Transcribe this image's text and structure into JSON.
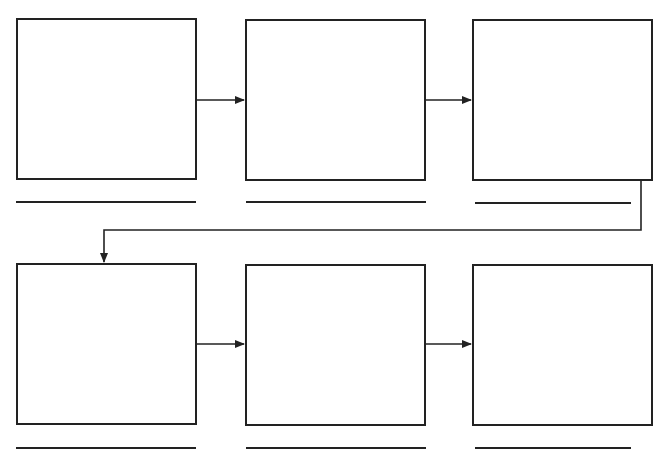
{
  "diagram": {
    "type": "flowchart-worksheet",
    "boxes": [
      {
        "id": 1,
        "label": ""
      },
      {
        "id": 2,
        "label": ""
      },
      {
        "id": 3,
        "label": ""
      },
      {
        "id": 4,
        "label": ""
      },
      {
        "id": 5,
        "label": ""
      },
      {
        "id": 6,
        "label": ""
      }
    ],
    "captions": [
      "",
      "",
      "",
      "",
      "",
      ""
    ],
    "colors": {
      "stroke": "#222222",
      "background": "#ffffff"
    }
  }
}
